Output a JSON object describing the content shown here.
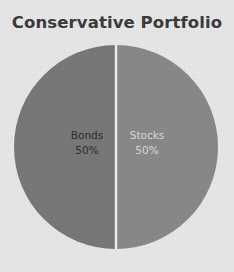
{
  "chart_data": {
    "type": "pie",
    "title": "Conservative Portfolio",
    "categories": [
      "Bonds",
      "Stocks"
    ],
    "values": [
      50,
      50
    ],
    "value_labels": [
      "50%",
      "50%"
    ],
    "units": "percent",
    "total": 100,
    "legend": "none",
    "grid": false,
    "start_angle_deg": 0,
    "direction": "clockwise",
    "slices": [
      {
        "label": "Bonds",
        "value": 50,
        "value_label": "50%",
        "color": "#8a8a8a",
        "text_color": "#2e2e2e",
        "position": "left"
      },
      {
        "label": "Stocks",
        "value": 50,
        "value_label": "50%",
        "color": "#797979",
        "text_color": "#dcdcdc",
        "position": "right"
      }
    ],
    "xlabel": "",
    "ylabel": ""
  },
  "figure": {
    "background_color": "#e9e9e9",
    "title_color": "#3c3c3c",
    "slice_divider_color": "#f2f2f2"
  }
}
